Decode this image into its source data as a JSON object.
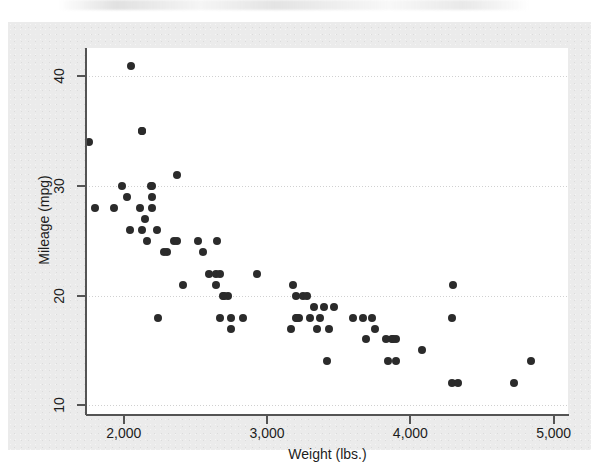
{
  "figure": {
    "background_color": "#ebebeb",
    "plot_background_color": "#ffffff",
    "axis_color": "#545454",
    "marker_color": "#2b2b2b",
    "gridline_color": "#c8c8c8"
  },
  "chart_data": {
    "type": "scatter",
    "title": "",
    "subtitle": "",
    "xlabel": "Weight (lbs.)",
    "ylabel": "Mileage (mpg)",
    "xlim": [
      1736,
      5100
    ],
    "ylim": [
      9.2,
      42.6
    ],
    "xticks": [
      2000,
      3000,
      4000,
      5000
    ],
    "xticklabels": [
      "2,000",
      "3,000",
      "4,000",
      "5,000"
    ],
    "yticks": [
      10,
      20,
      30,
      40
    ],
    "yticklabels": [
      "10",
      "20",
      "30",
      "40"
    ],
    "grid": "horizontal",
    "legend": "none",
    "marker": "circle",
    "series": [
      {
        "name": "Automobiles",
        "x": [
          2930,
          3350,
          2640,
          3250,
          4080,
          3670,
          2230,
          3280,
          3880,
          3400,
          3420,
          3845,
          4300,
          3900,
          4290,
          4330,
          3900,
          4290,
          2110,
          2200,
          2150,
          2670,
          2595,
          2700,
          2556,
          2200,
          3330,
          3370,
          2730,
          3200,
          3470,
          3600,
          3870,
          3755,
          3300,
          3690,
          3180,
          3220,
          2750,
          3430,
          3210,
          3200,
          2020,
          2130,
          2190,
          2690,
          2130,
          2650,
          1800,
          1760,
          2040,
          1930,
          4720,
          3730,
          3830,
          2050,
          2410,
          2200,
          2520,
          2300,
          2830,
          2130,
          1990,
          2350,
          2640,
          2370,
          2160,
          2670,
          2370,
          2280,
          2750,
          3170,
          2240,
          4840
        ],
        "y": [
          22,
          17,
          22,
          20,
          15,
          18,
          26,
          20,
          16,
          19,
          14,
          14,
          21,
          14,
          12,
          12,
          16,
          18,
          28,
          30,
          27,
          22,
          22,
          20,
          24,
          29,
          19,
          18,
          20,
          20,
          19,
          18,
          16,
          17,
          18,
          16,
          21,
          18,
          18,
          17,
          18,
          18,
          29,
          35,
          30,
          20,
          35,
          25,
          28,
          34,
          26,
          28,
          12,
          18,
          16,
          41,
          21,
          28,
          25,
          24,
          18,
          26,
          30,
          25,
          21,
          31,
          25,
          18,
          25,
          24,
          17,
          17,
          18,
          14
        ]
      }
    ]
  },
  "axes": {
    "y_title": "Mileage (mpg)",
    "x_title": "Weight (lbs.)"
  }
}
